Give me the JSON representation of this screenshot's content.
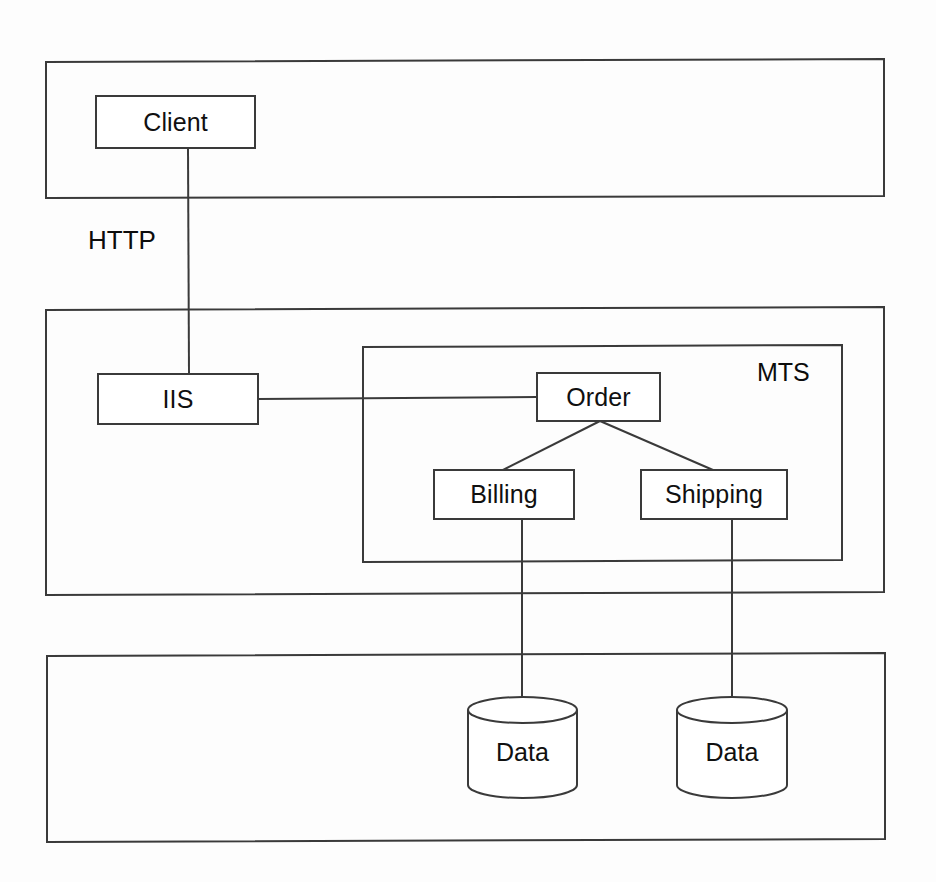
{
  "diagram": {
    "type": "three-tier-architecture",
    "background_color": "#fdfdfd",
    "stroke_color": "#3a3a3a",
    "text_color": "#101010",
    "tiers": [
      {
        "id": "presentation-tier",
        "label": "",
        "x": 46,
        "y": 59,
        "width": 838,
        "height": 138
      },
      {
        "id": "application-tier",
        "label": "",
        "x": 46,
        "y": 307,
        "width": 838,
        "height": 288
      },
      {
        "id": "data-tier",
        "label": "",
        "x": 47,
        "y": 653,
        "width": 838,
        "height": 189
      }
    ],
    "containers": [
      {
        "id": "mts-container",
        "label": "MTS",
        "x": 363,
        "y": 345,
        "width": 479,
        "height": 217,
        "label_x": 757,
        "label_y": 360
      }
    ],
    "nodes": [
      {
        "id": "client",
        "label": "Client",
        "shape": "rect",
        "x": 96,
        "y": 96,
        "width": 159,
        "height": 52
      },
      {
        "id": "iis",
        "label": "IIS",
        "shape": "rect",
        "x": 98,
        "y": 374,
        "width": 160,
        "height": 50
      },
      {
        "id": "order",
        "label": "Order",
        "shape": "rect",
        "x": 537,
        "y": 373,
        "width": 123,
        "height": 48
      },
      {
        "id": "billing",
        "label": "Billing",
        "shape": "rect",
        "x": 434,
        "y": 470,
        "width": 140,
        "height": 49
      },
      {
        "id": "shipping",
        "label": "Shipping",
        "shape": "rect",
        "x": 641,
        "y": 470,
        "width": 146,
        "height": 49
      },
      {
        "id": "data-1",
        "label": "Data",
        "shape": "cylinder",
        "x": 468,
        "y": 698,
        "width": 109,
        "height": 99
      },
      {
        "id": "data-2",
        "label": "Data",
        "shape": "cylinder",
        "x": 677,
        "y": 698,
        "width": 110,
        "height": 99
      }
    ],
    "edges": [
      {
        "id": "client-to-iis",
        "from": "client",
        "to": "iis",
        "label": "HTTP",
        "label_x": 88,
        "label_y": 227
      },
      {
        "id": "iis-to-order",
        "from": "iis",
        "to": "order",
        "label": ""
      },
      {
        "id": "order-to-billing",
        "from": "order",
        "to": "billing",
        "label": ""
      },
      {
        "id": "order-to-shipping",
        "from": "order",
        "to": "shipping",
        "label": ""
      },
      {
        "id": "billing-to-data-1",
        "from": "billing",
        "to": "data-1",
        "label": ""
      },
      {
        "id": "shipping-to-data-2",
        "from": "shipping",
        "to": "data-2",
        "label": ""
      }
    ]
  }
}
